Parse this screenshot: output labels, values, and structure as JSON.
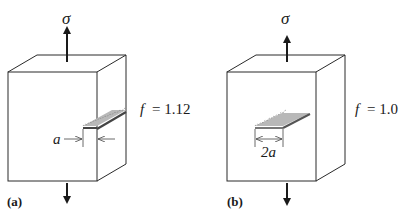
{
  "panels": [
    {
      "id": "a",
      "panel_label": "(a)",
      "stress_symbol": "σ",
      "factor_label": "f",
      "factor_eq": "= 1.12",
      "crack_type": "edge crack",
      "dimension_label": "a"
    },
    {
      "id": "b",
      "panel_label": "(b)",
      "stress_symbol": "σ",
      "factor_label": "f",
      "factor_eq": "= 1.0",
      "crack_type": "internal crack",
      "dimension_label": "2a"
    }
  ],
  "colors": {
    "line": "#2a2a2a",
    "crack_fill": "#b8b8b8",
    "crack_edge": "#555555",
    "background": "#ffffff"
  }
}
